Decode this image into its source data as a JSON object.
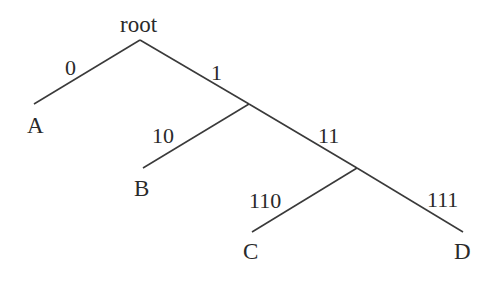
{
  "diagram": {
    "type": "binary-code-tree",
    "root": {
      "label": "root"
    },
    "nodes": {
      "A": {
        "label": "A"
      },
      "B": {
        "label": "B"
      },
      "C": {
        "label": "C"
      },
      "D": {
        "label": "D"
      }
    },
    "edges": [
      {
        "from": "root",
        "to": "A",
        "label": "0"
      },
      {
        "from": "root",
        "to": "n1",
        "label": "1"
      },
      {
        "from": "n1",
        "to": "B",
        "label": "10"
      },
      {
        "from": "n1",
        "to": "n11",
        "label": "11"
      },
      {
        "from": "n11",
        "to": "C",
        "label": "110"
      },
      {
        "from": "n11",
        "to": "D",
        "label": "111"
      }
    ],
    "codes": {
      "A": "0",
      "B": "10",
      "C": "110",
      "D": "111"
    },
    "colors": {
      "line": "#3a3a3a",
      "text": "#2a2a2a",
      "background": "#ffffff"
    }
  }
}
